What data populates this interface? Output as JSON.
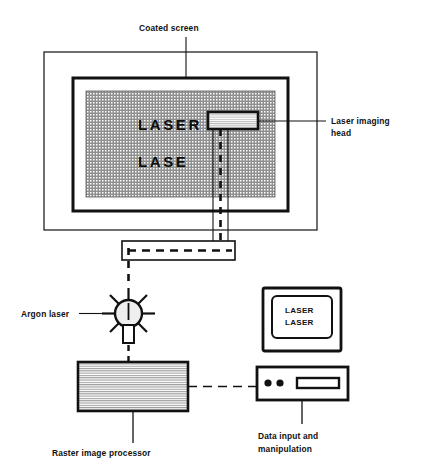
{
  "diagram": {
    "background_color": "#ffffff",
    "ink_color": "#111111"
  },
  "labels": {
    "coated_screen": "Coated screen",
    "laser_imaging_head_line1": "Laser imaging",
    "laser_imaging_head_line2": "head",
    "argon_laser": "Argon laser",
    "raster_image_processor": "Raster image processor",
    "data_input_line1": "Data input and",
    "data_input_line2": "manipulation"
  },
  "screen": {
    "text_line1": "LASER",
    "text_line2": "LASE",
    "fill_color": "#9a9a9a"
  },
  "monitor": {
    "text_line1": "LASER",
    "text_line2": "LASER"
  },
  "computer_base": {
    "button_count": 2,
    "drive_slot": "disk-drive-slot"
  },
  "rip": {
    "fill_pattern": "horizontal-hatch",
    "fill_color": "#d8d8d8"
  },
  "beam": {
    "style": "dashed",
    "color": "#111111"
  }
}
